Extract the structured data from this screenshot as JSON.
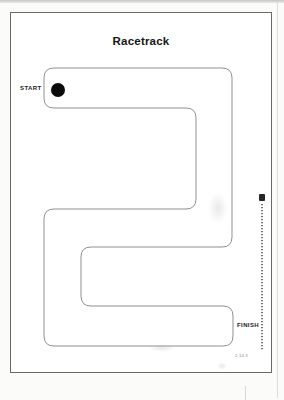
{
  "document": {
    "title": "Racetrack",
    "labels": {
      "start": "START",
      "finish": "FINISH"
    },
    "footer_code": "2.14.3"
  },
  "track": {
    "path": "M 43 55 H 211 Q 221 55 221 65 V 224 Q 221 234 211 234 H 80 Q 70 234 70 244 V 283 Q 70 293 80 293 H 212 Q 222 293 222 303 V 323 Q 222 333 212 333 H 43 Q 33 333 33 323 V 206 Q 33 196 43 196 H 175 Q 185 196 185 186 V 105 Q 185 95 175 95 H 43 Q 33 95 33 85 V 65 Q 33 55 43 55 Z",
    "stroke": "#8f8f8f",
    "start_dot": {
      "cx": 47,
      "cy": 77,
      "r": 7,
      "color": "#0a0a0a"
    }
  },
  "colors": {
    "paper": "#ffffff",
    "page_border": "#6a6a6a",
    "track_line": "#8f8f8f",
    "text": "#161616"
  }
}
